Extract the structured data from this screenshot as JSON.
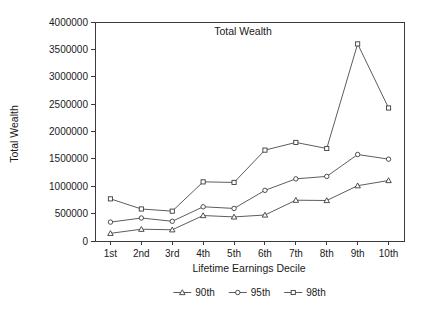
{
  "chart_data": {
    "type": "line",
    "title": "Total Wealth",
    "xlabel": "Lifetime Earnings Decile",
    "ylabel": "Total Wealth",
    "categories": [
      "1st",
      "2nd",
      "3rd",
      "4th",
      "5th",
      "6th",
      "7th",
      "8th",
      "9th",
      "10th"
    ],
    "ylim": [
      0,
      4000000
    ],
    "yticks": [
      0,
      500000,
      1000000,
      1500000,
      2000000,
      2500000,
      3000000,
      3500000,
      4000000
    ],
    "ytick_labels": [
      "0",
      "500000",
      "1000000",
      "1500000",
      "2000000",
      "2500000",
      "3000000",
      "3500000",
      "4000000"
    ],
    "grid": false,
    "legend_position": "bottom",
    "series": [
      {
        "name": "90th",
        "marker": "triangle",
        "values": [
          140000,
          215000,
          205000,
          465000,
          440000,
          475000,
          745000,
          740000,
          1010000,
          1105000
        ]
      },
      {
        "name": "95th",
        "marker": "circle",
        "values": [
          345000,
          420000,
          360000,
          625000,
          595000,
          925000,
          1135000,
          1180000,
          1580000,
          1495000
        ]
      },
      {
        "name": "98th",
        "marker": "square",
        "values": [
          770000,
          585000,
          545000,
          1080000,
          1070000,
          1660000,
          1800000,
          1690000,
          3600000,
          2430000
        ]
      }
    ]
  }
}
